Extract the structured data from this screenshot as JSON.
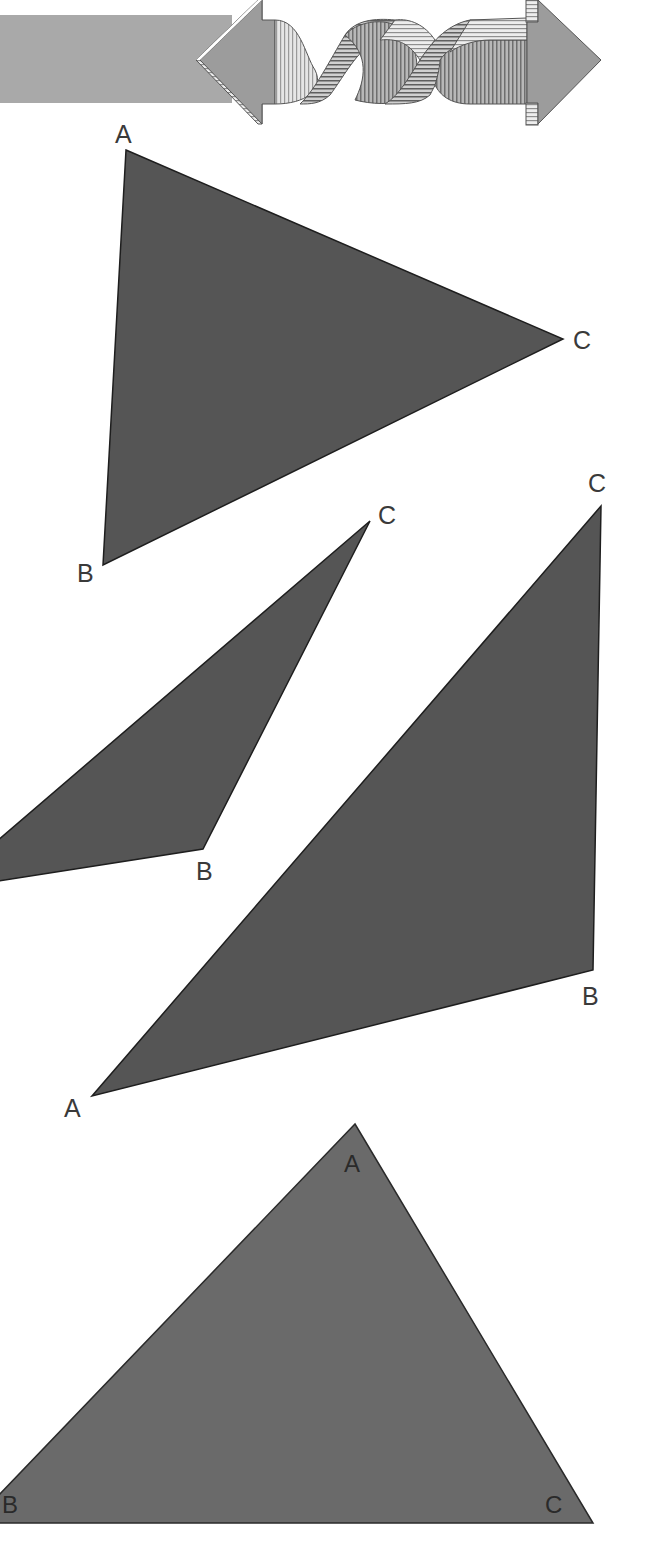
{
  "banner": {
    "icon": "twisted-double-arrow-icon",
    "bar_color": "#a9a9a9",
    "arrow_color": "#9c9c9c"
  },
  "triangles": [
    {
      "id": "triangle-1",
      "fill": "#555555",
      "vertices": [
        {
          "label": "A",
          "x": 126,
          "y": 150,
          "label_x": 115,
          "label_y": 143
        },
        {
          "label": "C",
          "x": 563,
          "y": 339,
          "label_x": 573,
          "label_y": 349
        },
        {
          "label": "B",
          "x": 103,
          "y": 565,
          "label_x": 77,
          "label_y": 582
        }
      ]
    },
    {
      "id": "triangle-2",
      "fill": "#555555",
      "vertices": [
        {
          "label": "C",
          "x": 370,
          "y": 521,
          "label_x": 378,
          "label_y": 524
        },
        {
          "label": "B",
          "x": 203,
          "y": 849,
          "label_x": 196,
          "label_y": 880
        },
        {
          "label": "A",
          "x": -60,
          "y": 890,
          "label_x": null,
          "label_y": null
        }
      ]
    },
    {
      "id": "triangle-3",
      "fill": "#555555",
      "vertices": [
        {
          "label": "C",
          "x": 601,
          "y": 506,
          "label_x": 588,
          "label_y": 492
        },
        {
          "label": "B",
          "x": 593,
          "y": 970,
          "label_x": 582,
          "label_y": 1005
        },
        {
          "label": "A",
          "x": 92,
          "y": 1096,
          "label_x": 64,
          "label_y": 1117
        }
      ]
    },
    {
      "id": "triangle-4",
      "fill": "#6a6a6a",
      "vertices": [
        {
          "label": "A",
          "x": 355,
          "y": 1124,
          "label_x": 344,
          "label_y": 1172
        },
        {
          "label": "C",
          "x": 593,
          "y": 1523,
          "label_x": 545,
          "label_y": 1513
        },
        {
          "label": "B",
          "x": -28,
          "y": 1523,
          "label_x": 2,
          "label_y": 1513
        }
      ]
    }
  ]
}
